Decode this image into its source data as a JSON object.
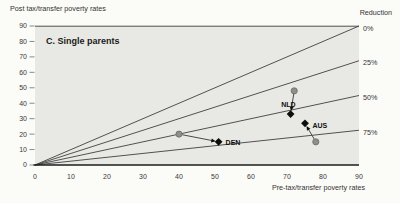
{
  "labels": {
    "reduction_header": "Reduction"
  },
  "chart_data": {
    "type": "scatter",
    "title": "C. Single parents",
    "xlabel": "Pre-tax/transfer poverty rates",
    "ylabel": "Post tax/transfer poverty rates",
    "xlim": [
      0,
      90
    ],
    "ylim": [
      0,
      90
    ],
    "x_ticks": [
      0,
      10,
      20,
      30,
      40,
      50,
      60,
      70,
      80,
      90
    ],
    "y_ticks": [
      0,
      10,
      20,
      30,
      40,
      50,
      60,
      70,
      80,
      90
    ],
    "grid": false,
    "legend_position": "none",
    "reference_lines": [
      {
        "label": "0%",
        "reduction_pct": 0
      },
      {
        "label": "25%",
        "reduction_pct": 25
      },
      {
        "label": "50%",
        "reduction_pct": 50
      },
      {
        "label": "75%",
        "reduction_pct": 75
      }
    ],
    "series": [
      {
        "name": "DEN",
        "marker_from": "gray-circle",
        "marker_to": "black-diamond",
        "from": {
          "x": 40,
          "y": 20
        },
        "to": {
          "x": 51,
          "y": 15
        }
      },
      {
        "name": "NLD",
        "marker_from": "gray-circle",
        "marker_to": "black-diamond",
        "from": {
          "x": 72,
          "y": 48
        },
        "to": {
          "x": 71,
          "y": 33
        }
      },
      {
        "name": "AUS",
        "marker_from": "gray-circle",
        "marker_to": "black-diamond",
        "from": {
          "x": 78,
          "y": 15
        },
        "to": {
          "x": 75,
          "y": 27
        }
      }
    ]
  },
  "colors": {
    "plot_bg": "#e8e8e4",
    "line": "#404040",
    "axis": "#1c1c1c",
    "tick": "#8a8a8a",
    "circle_fill": "#8e8e8e",
    "circle_stroke": "#6a6a6a",
    "diamond": "#0d0d0d",
    "arrow": "#4a4a4a"
  }
}
